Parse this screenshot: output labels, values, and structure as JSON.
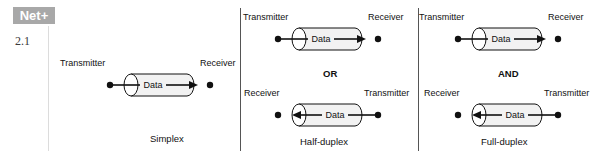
{
  "badge": {
    "text": "Net+",
    "objective": "2.1",
    "color": "#a8a8a8"
  },
  "labels": {
    "transmitter": "Transmitter",
    "receiver": "Receiver",
    "data": "Data"
  },
  "conjunctions": {
    "or": "OR",
    "and": "AND"
  },
  "panels": [
    {
      "caption": "Simplex",
      "rows": [
        {
          "left_label": "Transmitter",
          "right_label": "Receiver",
          "pipe_label": "Data",
          "direction": "right"
        }
      ]
    },
    {
      "caption": "Half-duplex",
      "conjunction": "OR",
      "rows": [
        {
          "left_label": "Transmitter",
          "right_label": "Receiver",
          "pipe_label": "Data",
          "direction": "right"
        },
        {
          "left_label": "Receiver",
          "right_label": "Transmitter",
          "pipe_label": "Data",
          "direction": "left"
        }
      ]
    },
    {
      "caption": "Full-duplex",
      "conjunction": "AND",
      "rows": [
        {
          "left_label": "Transmitter",
          "right_label": "Receiver",
          "pipe_label": "Data",
          "direction": "right"
        },
        {
          "left_label": "Receiver",
          "right_label": "Transmitter",
          "pipe_label": "Data",
          "direction": "left"
        }
      ]
    }
  ]
}
